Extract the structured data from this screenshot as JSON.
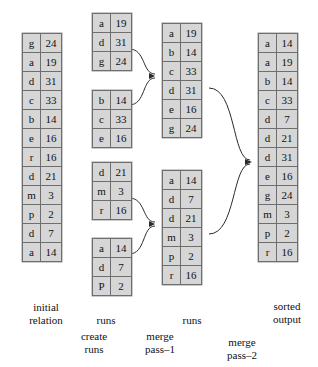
{
  "diagram": {
    "cell_fill": "#d6d6d6",
    "cell_border": "#6e6e6e",
    "arrow_color": "#2b2b2b"
  },
  "columns": {
    "initial_relation": {
      "caption": "initial\nrelation",
      "blocks": [
        {
          "rows": [
            {
              "key": "g",
              "val": "24"
            },
            {
              "key": "a",
              "val": "19"
            },
            {
              "key": "d",
              "val": "31"
            },
            {
              "key": "c",
              "val": "33"
            },
            {
              "key": "b",
              "val": "14"
            },
            {
              "key": "e",
              "val": "16"
            },
            {
              "key": "r",
              "val": "16"
            },
            {
              "key": "d",
              "val": "21"
            },
            {
              "key": "m",
              "val": "3"
            },
            {
              "key": "p",
              "val": "2"
            },
            {
              "key": "d",
              "val": "7"
            },
            {
              "key": "a",
              "val": "14"
            }
          ]
        }
      ]
    },
    "create_runs": {
      "caption": "runs",
      "process_caption": "create\nruns",
      "blocks": [
        {
          "rows": [
            {
              "key": "a",
              "val": "19"
            },
            {
              "key": "d",
              "val": "31"
            },
            {
              "key": "g",
              "val": "24"
            }
          ]
        },
        {
          "rows": [
            {
              "key": "b",
              "val": "14"
            },
            {
              "key": "c",
              "val": "33"
            },
            {
              "key": "e",
              "val": "16"
            }
          ]
        },
        {
          "rows": [
            {
              "key": "d",
              "val": "21"
            },
            {
              "key": "m",
              "val": "3"
            },
            {
              "key": "r",
              "val": "16"
            }
          ]
        },
        {
          "rows": [
            {
              "key": "a",
              "val": "14"
            },
            {
              "key": "d",
              "val": "7"
            },
            {
              "key": "P",
              "val": "2"
            }
          ]
        }
      ]
    },
    "merge_pass_1": {
      "caption": "runs",
      "process_caption": "merge\npass–1",
      "blocks": [
        {
          "rows": [
            {
              "key": "a",
              "val": "19"
            },
            {
              "key": "b",
              "val": "14"
            },
            {
              "key": "c",
              "val": "33"
            },
            {
              "key": "d",
              "val": "31"
            },
            {
              "key": "e",
              "val": "16"
            },
            {
              "key": "g",
              "val": "24"
            }
          ]
        },
        {
          "rows": [
            {
              "key": "a",
              "val": "14"
            },
            {
              "key": "d",
              "val": "7"
            },
            {
              "key": "d",
              "val": "21"
            },
            {
              "key": "m",
              "val": "3"
            },
            {
              "key": "p",
              "val": "2"
            },
            {
              "key": "r",
              "val": "16"
            }
          ]
        }
      ]
    },
    "merge_pass_2": {
      "process_caption": "merge\npass–2"
    },
    "sorted_output": {
      "caption": "sorted\noutput",
      "blocks": [
        {
          "rows": [
            {
              "key": "a",
              "val": "14"
            },
            {
              "key": "a",
              "val": "19"
            },
            {
              "key": "b",
              "val": "14"
            },
            {
              "key": "c",
              "val": "33"
            },
            {
              "key": "d",
              "val": "7"
            },
            {
              "key": "d",
              "val": "21"
            },
            {
              "key": "d",
              "val": "31"
            },
            {
              "key": "e",
              "val": "16"
            },
            {
              "key": "g",
              "val": "24"
            },
            {
              "key": "m",
              "val": "3"
            },
            {
              "key": "p",
              "val": "2"
            },
            {
              "key": "r",
              "val": "16"
            }
          ]
        }
      ]
    }
  }
}
